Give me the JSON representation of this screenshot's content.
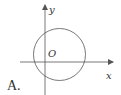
{
  "diagram": {
    "option_label": "A.",
    "axes": {
      "x_label": "x",
      "y_label": "y",
      "origin_label": "O"
    },
    "circle": {
      "description": "circle intersecting both axes, center in first quadrant near origin"
    },
    "colors": {
      "stroke": "#555555",
      "text": "#333333"
    }
  }
}
